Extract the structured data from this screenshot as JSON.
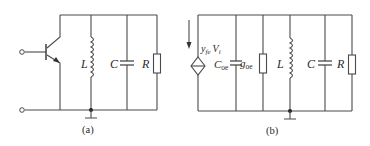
{
  "figure": {
    "circuit_a": {
      "caption": "(a)",
      "components": {
        "inductor": "L",
        "capacitor": "C",
        "resistor": "R"
      }
    },
    "circuit_b": {
      "caption": "(b)",
      "source": {
        "main": "y",
        "sub": "fe",
        "main2": "V",
        "sub2": "i"
      },
      "components": {
        "output_capacitance": {
          "main": "C",
          "sub": "oe"
        },
        "output_conductance": {
          "main": "g",
          "sub": "oe"
        },
        "inductor": "L",
        "capacitor": "C",
        "resistor": "R"
      }
    }
  }
}
